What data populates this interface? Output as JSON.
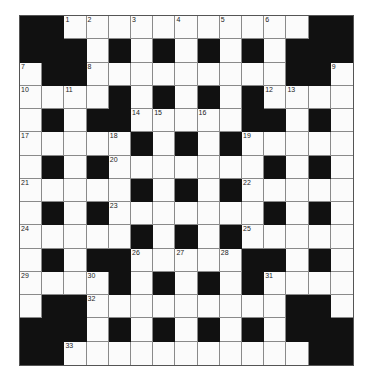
{
  "puzzle": {
    "rows": 15,
    "cols": 15,
    "grid": [
      "##...........##",
      "###.#.#.#.#.###",
      ".##.........##.",
      "....#.#.#.#....",
      ".#.##.....##.#.",
      ".....#.#.#.....",
      ".#.#.......#.#.",
      ".....#.#.#.....",
      ".#.#.......#.#.",
      ".....#.#.#.....",
      ".#.##.....##.#.",
      "....#.#.#.#....",
      ".##.........##.",
      "###.#.#.#.#.###",
      "##...........##"
    ],
    "numbers": [
      {
        "r": 0,
        "c": 2,
        "n": "1"
      },
      {
        "r": 0,
        "c": 3,
        "n": "2"
      },
      {
        "r": 0,
        "c": 5,
        "n": "3"
      },
      {
        "r": 0,
        "c": 7,
        "n": "4"
      },
      {
        "r": 0,
        "c": 9,
        "n": "5"
      },
      {
        "r": 0,
        "c": 11,
        "n": "6"
      },
      {
        "r": 2,
        "c": 0,
        "n": "7"
      },
      {
        "r": 2,
        "c": 3,
        "n": "8"
      },
      {
        "r": 2,
        "c": 14,
        "n": "9"
      },
      {
        "r": 3,
        "c": 0,
        "n": "10"
      },
      {
        "r": 3,
        "c": 2,
        "n": "11"
      },
      {
        "r": 3,
        "c": 11,
        "n": "12"
      },
      {
        "r": 3,
        "c": 12,
        "n": "13"
      },
      {
        "r": 4,
        "c": 5,
        "n": "14"
      },
      {
        "r": 4,
        "c": 6,
        "n": "15"
      },
      {
        "r": 4,
        "c": 8,
        "n": "16"
      },
      {
        "r": 5,
        "c": 0,
        "n": "17"
      },
      {
        "r": 5,
        "c": 4,
        "n": "18"
      },
      {
        "r": 5,
        "c": 10,
        "n": "19"
      },
      {
        "r": 6,
        "c": 4,
        "n": "20"
      },
      {
        "r": 7,
        "c": 0,
        "n": "21"
      },
      {
        "r": 7,
        "c": 10,
        "n": "22"
      },
      {
        "r": 8,
        "c": 4,
        "n": "23"
      },
      {
        "r": 9,
        "c": 0,
        "n": "24"
      },
      {
        "r": 9,
        "c": 10,
        "n": "25"
      },
      {
        "r": 10,
        "c": 5,
        "n": "26"
      },
      {
        "r": 10,
        "c": 7,
        "n": "27"
      },
      {
        "r": 10,
        "c": 9,
        "n": "28"
      },
      {
        "r": 11,
        "c": 0,
        "n": "29"
      },
      {
        "r": 11,
        "c": 3,
        "n": "30"
      },
      {
        "r": 11,
        "c": 11,
        "n": "31"
      },
      {
        "r": 12,
        "c": 3,
        "n": "32"
      },
      {
        "r": 14,
        "c": 2,
        "n": "33"
      }
    ],
    "colors": {
      "white_cell": "#fbfbfb",
      "black_cell": "#111111",
      "grid_line": "#8a8a8a"
    }
  }
}
